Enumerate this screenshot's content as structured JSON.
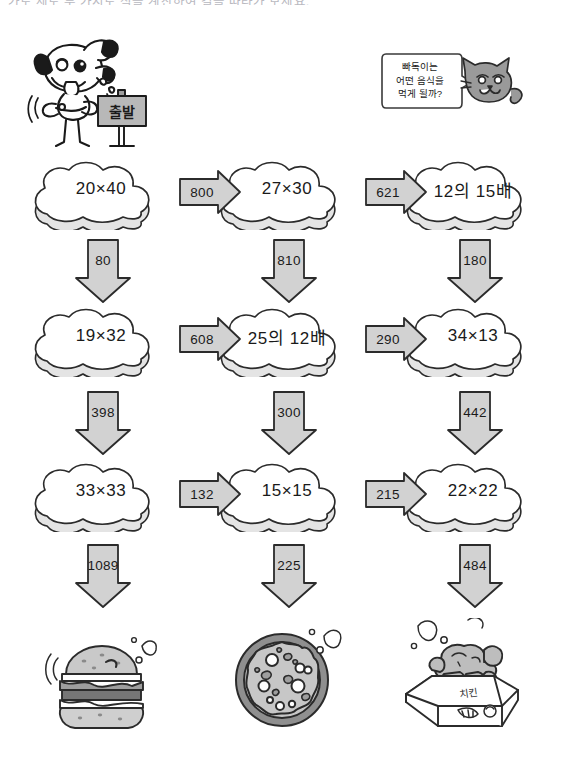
{
  "page": {
    "top_instruction": "가로 세로 두 가지로 식을 계산하여 길을 따라가 보세요."
  },
  "characters": {
    "dog": {
      "icon": "dog-character-icon",
      "sign_text": "출발"
    },
    "cat": {
      "icon": "cat-character-icon",
      "speech_lines": [
        "빠독이는",
        "어떤 음식을",
        "먹게 될까?"
      ]
    }
  },
  "grid": {
    "rows": [
      {
        "clouds": [
          "20×40",
          "27×30",
          "12의 15배"
        ],
        "h_arrows": [
          "800",
          "621"
        ],
        "v_arrows": [
          "80",
          "810",
          "180"
        ]
      },
      {
        "clouds": [
          "19×32",
          "25의 12배",
          "34×13"
        ],
        "h_arrows": [
          "608",
          "290"
        ],
        "v_arrows": [
          "398",
          "300",
          "442"
        ]
      },
      {
        "clouds": [
          "33×33",
          "15×15",
          "22×22"
        ],
        "h_arrows": [
          "132",
          "215"
        ],
        "v_arrows": [
          "1089",
          "225",
          "484"
        ]
      }
    ]
  },
  "foods": [
    {
      "icon": "hamburger-icon"
    },
    {
      "icon": "pizza-icon"
    },
    {
      "icon": "fried-chicken-box-icon"
    }
  ],
  "colors": {
    "arrow_fill": "#d2d2d2",
    "arrow_stroke": "#2b2b2b",
    "cloud_fill": "#ffffff",
    "cloud_shadow": "#e4e4e4",
    "cloud_stroke": "#2b2b2b",
    "cat_fill": "#9a9a9a",
    "text": "#1a1a1a"
  }
}
